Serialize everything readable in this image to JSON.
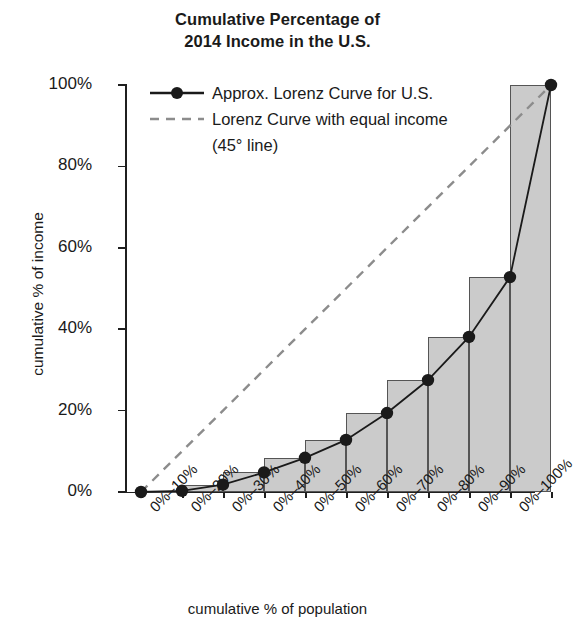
{
  "chart_data": {
    "type": "bar",
    "title": "Cumulative Percentage of 2014 Income in the U.S.",
    "title_line1": "Cumulative Percentage of",
    "title_line2": "2014 Income in the U.S.",
    "xlabel": "cumulative % of population",
    "ylabel": "cumulative % of income",
    "categories": [
      "0%–10%",
      "0%–20%",
      "0%–30%",
      "0%–40%",
      "0%–50%",
      "0%–60%",
      "0%–70%",
      "0%–80%",
      "0%–90%",
      "0%–100%"
    ],
    "values": [
      0.3,
      1.8,
      4.8,
      8.4,
      12.8,
      19.4,
      27.5,
      38.1,
      52.8,
      100
    ],
    "series": [
      {
        "name": "Approx. Lorenz Curve for U.S.",
        "values": [
          0.3,
          1.8,
          4.8,
          8.4,
          12.8,
          19.4,
          27.5,
          38.1,
          52.8,
          100
        ],
        "style": "solid-marker"
      },
      {
        "name": "Lorenz Curve with equal income (45° line)",
        "values": [
          10,
          20,
          30,
          40,
          50,
          60,
          70,
          80,
          90,
          100
        ],
        "style": "dashed"
      }
    ],
    "ylim": [
      0,
      100
    ],
    "ytick_labels": [
      "0%",
      "20%",
      "40%",
      "60%",
      "80%",
      "100%"
    ],
    "ytick_values": [
      0,
      20,
      40,
      60,
      80,
      100
    ],
    "grid": false,
    "legend_position": "upper-left-inside",
    "bar_fill_color": "#cbcbcb",
    "bar_edge_color": "#555555",
    "line_color": "#1a1a1a",
    "dashed_color": "#8c8c8c"
  },
  "legend": {
    "entries": [
      {
        "label": "Approx. Lorenz Curve for U.S.",
        "marker": "line-with-dot-marker"
      },
      {
        "label": "Lorenz Curve with equal income",
        "marker": "dashed-line"
      },
      {
        "label": "(45° line)",
        "marker": "none"
      }
    ]
  }
}
